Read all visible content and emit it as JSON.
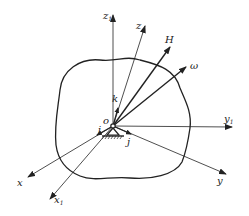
{
  "diagram": {
    "origin": {
      "label": "o",
      "x": 113,
      "y": 126
    },
    "axes": [
      {
        "name": "z1",
        "label": "z",
        "sub": "1",
        "to": [
          113,
          15
        ],
        "lx": 103,
        "ly": 19
      },
      {
        "name": "z",
        "label": "z",
        "sub": "",
        "to": [
          145,
          26
        ],
        "lx": 136,
        "ly": 29
      },
      {
        "name": "H",
        "label": "H",
        "sub": "",
        "to": [
          170,
          47
        ],
        "lx": 167,
        "ly": 43
      },
      {
        "name": "omega",
        "label": "ω",
        "sub": "",
        "to": [
          186,
          67
        ],
        "lx": 191,
        "ly": 69
      },
      {
        "name": "y1",
        "label": "y",
        "sub": "1",
        "to": [
          232,
          127
        ],
        "lx": 225,
        "ly": 122
      },
      {
        "name": "y",
        "label": "y",
        "sub": "",
        "to": [
          226,
          174
        ],
        "lx": 218,
        "ly": 184
      },
      {
        "name": "x",
        "label": "x",
        "sub": "",
        "to": [
          28,
          177
        ],
        "lx": 18,
        "ly": 185
      },
      {
        "name": "x1",
        "label": "x",
        "sub": "1",
        "to": [
          50,
          199
        ],
        "lx": 55,
        "ly": 203
      }
    ],
    "unit_vectors": [
      {
        "name": "k",
        "label": "k",
        "lx": 113,
        "ly": 101
      },
      {
        "name": "i",
        "label": "i",
        "lx": 99,
        "ly": 134
      },
      {
        "name": "j",
        "label": "j",
        "lx": 127,
        "ly": 145
      }
    ],
    "colors": {
      "line": "#222222"
    }
  }
}
